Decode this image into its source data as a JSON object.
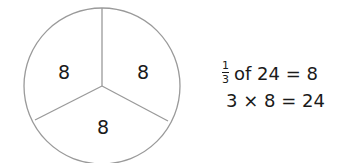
{
  "diagram": {
    "type": "fraction-circle",
    "parts": [
      {
        "label": "8"
      },
      {
        "label": "8"
      },
      {
        "label": "8"
      }
    ]
  },
  "equations": {
    "line1": {
      "numerator": "1",
      "denominator": "3",
      "rest": "of 24 = 8"
    },
    "line2": "3 × 8 = 24"
  },
  "colors": {
    "stroke": "#9a9a9a",
    "text": "#1a1a1a"
  }
}
